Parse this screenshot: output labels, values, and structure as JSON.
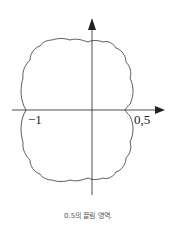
{
  "figure": {
    "caption": "0.5의 끌림 영역.",
    "labels": {
      "x_left": "−1",
      "x_right": "0,5"
    },
    "colors": {
      "stroke": "#222222",
      "background": "#ffffff"
    }
  }
}
